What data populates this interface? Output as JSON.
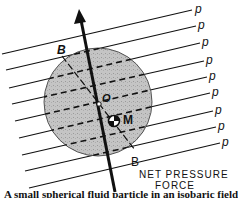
{
  "diagram": {
    "pressure_label": "p",
    "pressure_label_count": 9,
    "point_labels": {
      "center": "O",
      "center_of_mass": "M",
      "axis_top": "B",
      "axis_bottom": "B"
    },
    "force_label_line1": "NET PRESSURE",
    "force_label_line2": "FORCE",
    "caption": "A small spherical fluid particle in an isobaric field"
  },
  "colors": {
    "ink": "#111111",
    "sphere_fill": "#bdbdbd",
    "background": "#ffffff"
  }
}
